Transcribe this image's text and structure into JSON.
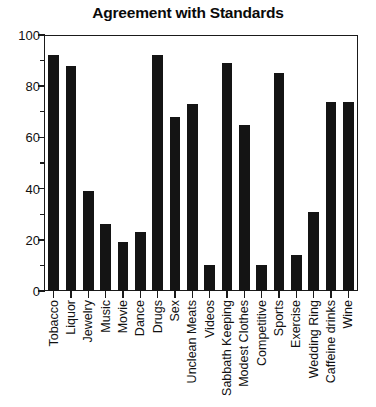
{
  "chart_data": {
    "type": "bar",
    "title": "Agreement with Standards",
    "xlabel": "",
    "ylabel": "",
    "ylim": [
      0,
      100
    ],
    "y_ticks": [
      0,
      20,
      40,
      60,
      80,
      100
    ],
    "y_minor_ticks": [
      10,
      30,
      50,
      70,
      90
    ],
    "grid": false,
    "legend": "none",
    "bar_color": "#141414",
    "categories": [
      "Tobacco",
      "Liquor",
      "Jewelry",
      "Music",
      "Movie",
      "Dance",
      "Drugs",
      "Sex",
      "Unclean Meats",
      "Videos",
      "Sabbath Keeping",
      "Modest Clothes",
      "Competitive",
      "Sports",
      "Exercise",
      "Wedding Ring",
      "Caffeine drinks",
      "Wine"
    ],
    "values": [
      92,
      88,
      39,
      26,
      19,
      23,
      92,
      68,
      73,
      10,
      89,
      65,
      10,
      85,
      14,
      31,
      74,
      74
    ]
  }
}
